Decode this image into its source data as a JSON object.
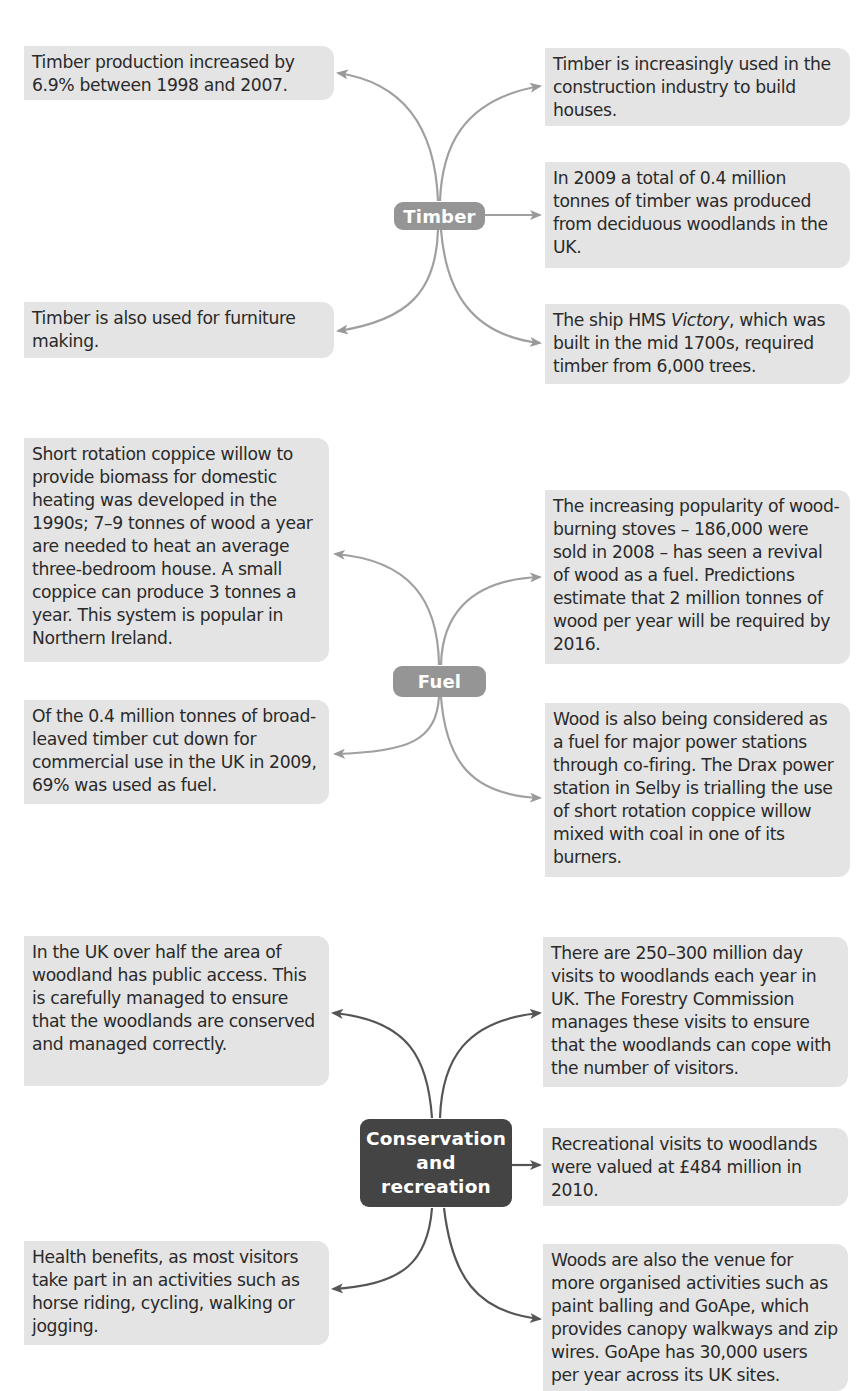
{
  "colors": {
    "box_fill": "#e4e4e4",
    "text": "#2a2a2a",
    "hub_grey": "#959595",
    "hub_dark": "#444444",
    "arrow_grey": "#999999",
    "arrow_dark": "#555555"
  },
  "sections": {
    "timber": {
      "hub_label": "Timber",
      "boxes": {
        "left_top": "Timber production increased by 6.9% between 1998 and 2007.",
        "left_bottom": "Timber is also used for furniture making.",
        "right_top": "Timber is increasingly used in the construction industry to build houses.",
        "right_middle": "In 2009 a total of 0.4 million tonnes of timber was produced from deciduous woodlands in the UK.",
        "right_bottom_pre": "The ship HMS ",
        "right_bottom_italic": "Victory",
        "right_bottom_post": ", which was built in the mid 1700s, required timber from 6,000 trees."
      }
    },
    "fuel": {
      "hub_label": "Fuel",
      "boxes": {
        "left_top": "Short rotation coppice willow to provide biomass for domestic heating was developed in the 1990s; 7–9 tonnes of wood a year are needed to heat an average three-bedroom house. A small coppice can produce 3 tonnes a year. This system is popular in Northern Ireland.",
        "left_bottom": "Of the 0.4 million tonnes of broad-leaved timber cut down for commercial use in the UK in 2009, 69% was used as fuel.",
        "right_top": "The increasing popularity of wood-burning stoves – 186,000 were sold in 2008 – has seen a revival of wood as a fuel. Predictions estimate that 2 million tonnes of wood per year will be required by 2016.",
        "right_bottom": "Wood is also being considered as a fuel for major power stations through co-firing. The Drax power station in Selby is trialling the use of short rotation coppice willow mixed with coal in one of its burners."
      }
    },
    "conservation": {
      "hub_line1": "Conservation",
      "hub_line2": "and",
      "hub_line3": "recreation",
      "boxes": {
        "left_top": "In the UK over half the area of woodland has public access. This is carefully managed to ensure that the woodlands are conserved and managed correctly.",
        "left_bottom": "Health benefits, as most visitors take part in an activities such as horse riding, cycling, walking or jogging.",
        "right_top": "There are 250–300 million day visits to woodlands each year in UK. The Forestry Commission manages these visits to ensure that the woodlands can cope with the number of visitors.",
        "right_middle": "Recreational visits to woodlands were valued at £484 million in 2010.",
        "right_bottom": "Woods are also the venue for more organised activities such as paint balling and GoApe, which provides canopy walkways and zip wires. GoApe has 30,000 users per year across its UK sites."
      }
    }
  }
}
